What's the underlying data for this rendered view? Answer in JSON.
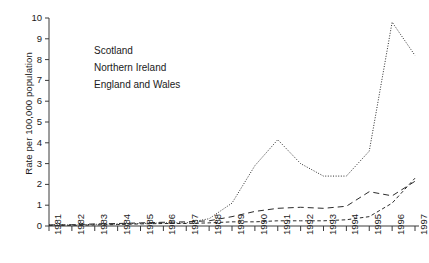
{
  "chart_data": {
    "type": "line",
    "title": "",
    "xlabel": "",
    "ylabel": "Rate per 100,000 population",
    "x": [
      1981,
      1982,
      1983,
      1984,
      1985,
      1986,
      1987,
      1988,
      1989,
      1990,
      1991,
      1992,
      1993,
      1994,
      1995,
      1996,
      1997
    ],
    "xticklabels": [
      "1981",
      "1982",
      "1983",
      "1984",
      "1985",
      "1986",
      "1987",
      "1988",
      "1989",
      "1990",
      "1991",
      "1992",
      "1993",
      "1994",
      "1995",
      "1996",
      "1997"
    ],
    "yticklabels": [
      "0",
      "1",
      "2",
      "3",
      "4",
      "5",
      "6",
      "7",
      "8",
      "9",
      "10"
    ],
    "ylim": [
      0,
      10
    ],
    "xlim": [
      1981,
      1997
    ],
    "grid": false,
    "legend_position": "upper-left-inside",
    "series": [
      {
        "name": "Scotland",
        "dash": "dotted",
        "color": "#2b2b2b",
        "values": [
          0.05,
          0.05,
          0.08,
          0.1,
          0.12,
          0.15,
          0.15,
          0.35,
          1.1,
          2.9,
          4.15,
          3.0,
          2.4,
          2.4,
          3.6,
          9.8,
          8.2
        ]
      },
      {
        "name": "Northern Ireland",
        "dash": "short-dash",
        "color": "#2b2b2b",
        "values": [
          0.03,
          0.03,
          0.05,
          0.07,
          0.1,
          0.12,
          0.12,
          0.15,
          0.2,
          0.2,
          0.25,
          0.25,
          0.25,
          0.3,
          0.45,
          1.1,
          2.3
        ]
      },
      {
        "name": "England and Wales",
        "dash": "long-dash",
        "color": "#2b2b2b",
        "values": [
          0.05,
          0.06,
          0.1,
          0.12,
          0.15,
          0.18,
          0.2,
          0.25,
          0.45,
          0.7,
          0.85,
          0.9,
          0.85,
          0.95,
          1.65,
          1.45,
          2.15
        ]
      }
    ]
  },
  "axis": {
    "y_title": "Rate per 100,000 population"
  }
}
